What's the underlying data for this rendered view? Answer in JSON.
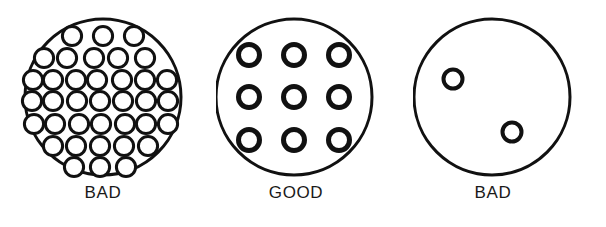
{
  "figure": {
    "background_color": "#ffffff",
    "stroke_color": "#111111",
    "fill_color": "#ffffff",
    "label_color": "#1a1a1a",
    "width": 606,
    "height": 227
  },
  "panels": [
    {
      "id": "panel-left",
      "label": "BAD",
      "quality": "BAD",
      "hole_count": 37,
      "density": "too-dense",
      "panel_left": 0,
      "disc": {
        "cx": 103,
        "cy": 97,
        "r": 78,
        "stroke_width": 3
      },
      "hole_radius": 9.6,
      "hole_stroke_width": 3,
      "holes": [
        {
          "cx": 72,
          "cy": 36
        },
        {
          "cx": 103,
          "cy": 36
        },
        {
          "cx": 134,
          "cy": 36
        },
        {
          "cx": 56,
          "cy": 57
        },
        {
          "cx": 87,
          "cy": 57
        },
        {
          "cx": 118,
          "cy": 57
        },
        {
          "cx": 149,
          "cy": 57
        },
        {
          "cx": 41,
          "cy": 57
        },
        {
          "cx": 37,
          "cy": 77
        },
        {
          "cx": 56,
          "cy": 77
        },
        {
          "cx": 78,
          "cy": 77
        },
        {
          "cx": 99,
          "cy": 77
        },
        {
          "cx": 120,
          "cy": 77
        },
        {
          "cx": 141,
          "cy": 77
        },
        {
          "cx": 162,
          "cy": 77
        },
        {
          "cx": 37,
          "cy": 97
        },
        {
          "cx": 58,
          "cy": 97
        },
        {
          "cx": 79,
          "cy": 97
        },
        {
          "cx": 100,
          "cy": 97
        },
        {
          "cx": 121,
          "cy": 97
        },
        {
          "cx": 142,
          "cy": 97
        },
        {
          "cx": 163,
          "cy": 97
        },
        {
          "cx": 37,
          "cy": 118
        },
        {
          "cx": 58,
          "cy": 118
        },
        {
          "cx": 80,
          "cy": 118
        },
        {
          "cx": 101,
          "cy": 118
        },
        {
          "cx": 122,
          "cy": 118
        },
        {
          "cx": 143,
          "cy": 118
        },
        {
          "cx": 164,
          "cy": 118
        },
        {
          "cx": 57,
          "cy": 139
        },
        {
          "cx": 78,
          "cy": 139
        },
        {
          "cx": 99,
          "cy": 139
        },
        {
          "cx": 120,
          "cy": 139
        },
        {
          "cx": 141,
          "cy": 139
        },
        {
          "cx": 76,
          "cy": 160
        },
        {
          "cx": 99,
          "cy": 160
        },
        {
          "cx": 124,
          "cy": 160
        }
      ]
    },
    {
      "id": "panel-middle",
      "label": "GOOD",
      "quality": "GOOD",
      "hole_count": 9,
      "density": "even-grid",
      "panel_left": 216,
      "disc": {
        "cx": 78,
        "cy": 97,
        "r": 78,
        "stroke_width": 3
      },
      "hole_radius": 10.5,
      "hole_stroke_width": 5,
      "holes": [
        {
          "cx": 33,
          "cy": 55
        },
        {
          "cx": 78,
          "cy": 55
        },
        {
          "cx": 123,
          "cy": 55
        },
        {
          "cx": 33,
          "cy": 97
        },
        {
          "cx": 78,
          "cy": 97
        },
        {
          "cx": 123,
          "cy": 97
        },
        {
          "cx": 33,
          "cy": 140
        },
        {
          "cx": 78,
          "cy": 140
        },
        {
          "cx": 123,
          "cy": 140
        }
      ]
    },
    {
      "id": "panel-right",
      "label": "BAD",
      "quality": "BAD",
      "hole_count": 2,
      "density": "too-sparse",
      "panel_left": 413,
      "disc": {
        "cx": 79,
        "cy": 97,
        "r": 78,
        "stroke_width": 3
      },
      "hole_radius": 9.5,
      "hole_stroke_width": 4,
      "holes": [
        {
          "cx": 40,
          "cy": 79
        },
        {
          "cx": 99,
          "cy": 132
        }
      ]
    }
  ],
  "labels": {
    "left": "BAD",
    "middle": "GOOD",
    "right": "BAD",
    "baseline_y": 192
  }
}
